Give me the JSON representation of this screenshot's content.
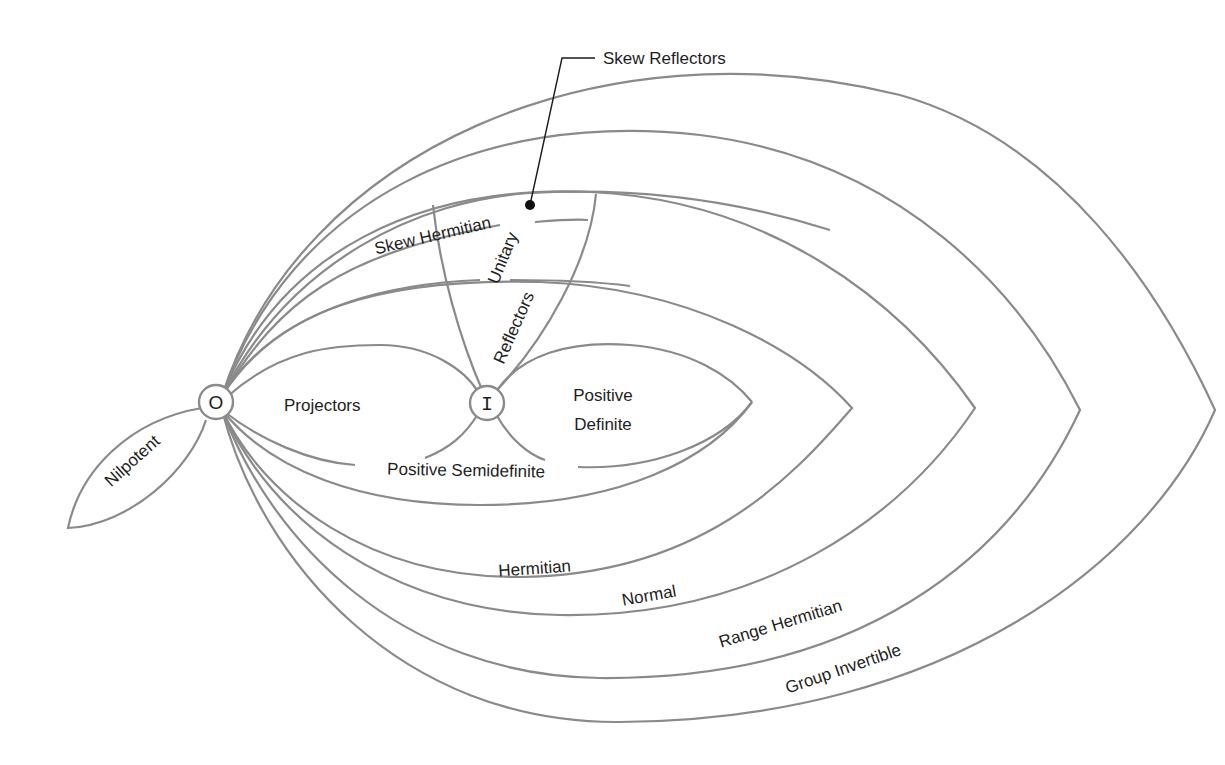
{
  "diagram": {
    "nodes": {
      "zero": {
        "label": "O"
      },
      "identity": {
        "label": "I"
      }
    },
    "regions": {
      "nilpotent": "Nilpotent",
      "projectors": "Projectors",
      "positive_definite_line1": "Positive",
      "positive_definite_line2": "Definite",
      "positive_semidefinite": "Positive Semidefinite",
      "hermitian": "Hermitian",
      "normal": "Normal",
      "range_hermitian": "Range Hermitian",
      "group_invertible": "Group Invertible",
      "skew_hermitian": "Skew Hermitian",
      "unitary": "Unitary",
      "reflectors": "Reflectors"
    },
    "callouts": {
      "skew_reflectors": "Skew Reflectors"
    },
    "colors": {
      "curve": "#8a8a8a",
      "text": "#1e1e1e",
      "background": "#ffffff"
    }
  }
}
